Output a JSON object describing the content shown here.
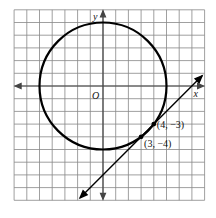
{
  "figure": {
    "type": "coordinate-plane",
    "x_axis_label": "x",
    "y_axis_label": "y",
    "origin_label": "O",
    "grid": {
      "x_min": -7,
      "x_max": 8,
      "y_min": -9,
      "y_max": 6,
      "step": 1
    },
    "circle": {
      "center": [
        0,
        0
      ],
      "radius": 5,
      "equation": "x^2 + y^2 = 25"
    },
    "line": {
      "through": [
        [
          3,
          -4
        ],
        [
          4,
          -3
        ]
      ],
      "slope": 1,
      "equation": "y = x - 7"
    },
    "points": [
      {
        "coords": [
          4,
          -3
        ],
        "label": "(4, −3)"
      },
      {
        "coords": [
          3,
          -4
        ],
        "label": "(3, −4)"
      }
    ],
    "colors": {
      "grid": "#777777",
      "curve": "#000000",
      "background": "#ffffff"
    }
  }
}
